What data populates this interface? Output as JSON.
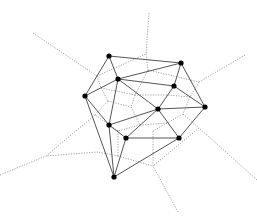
{
  "diagram": {
    "type": "delaunay-voronoi",
    "colors": {
      "background": "#ffffff",
      "delaunay_edge": "#555555",
      "voronoi_edge": "#8a8a8a",
      "site_point": "#000000"
    },
    "point_radius": 2.6,
    "points": [
      {
        "id": "P0",
        "x": 109,
        "y": 56
      },
      {
        "id": "P1",
        "x": 181,
        "y": 63
      },
      {
        "id": "P2",
        "x": 118,
        "y": 79
      },
      {
        "id": "P3",
        "x": 174,
        "y": 86
      },
      {
        "id": "P4",
        "x": 85,
        "y": 96
      },
      {
        "id": "P5",
        "x": 158,
        "y": 109
      },
      {
        "id": "P6",
        "x": 205,
        "y": 107
      },
      {
        "id": "P7",
        "x": 109,
        "y": 125
      },
      {
        "id": "P8",
        "x": 126,
        "y": 138
      },
      {
        "id": "P9",
        "x": 179,
        "y": 138
      },
      {
        "id": "P10",
        "x": 114,
        "y": 177
      }
    ],
    "delaunay_edges": [
      [
        0,
        1
      ],
      [
        0,
        2
      ],
      [
        0,
        4
      ],
      [
        1,
        2
      ],
      [
        1,
        3
      ],
      [
        1,
        6
      ],
      [
        2,
        3
      ],
      [
        2,
        4
      ],
      [
        2,
        5
      ],
      [
        2,
        7
      ],
      [
        3,
        5
      ],
      [
        3,
        6
      ],
      [
        4,
        7
      ],
      [
        4,
        10
      ],
      [
        5,
        6
      ],
      [
        5,
        7
      ],
      [
        5,
        8
      ],
      [
        5,
        9
      ],
      [
        6,
        9
      ],
      [
        7,
        8
      ],
      [
        7,
        10
      ],
      [
        8,
        9
      ],
      [
        8,
        10
      ],
      [
        9,
        10
      ]
    ],
    "voronoi_edges": [
      [
        [
          33,
          33
        ],
        [
          97,
          76
        ]
      ],
      [
        [
          97,
          76
        ],
        [
          101,
          88
        ]
      ],
      [
        [
          97,
          76
        ],
        [
          146,
          54
        ]
      ],
      [
        [
          149,
          13
        ],
        [
          146,
          54
        ]
      ],
      [
        [
          146,
          54
        ],
        [
          148,
          70
        ]
      ],
      [
        [
          148,
          70
        ],
        [
          135,
          95
        ]
      ],
      [
        [
          148,
          70
        ],
        [
          199,
          82
        ]
      ],
      [
        [
          245,
          55
        ],
        [
          199,
          82
        ]
      ],
      [
        [
          199,
          82
        ],
        [
          190,
          97
        ]
      ],
      [
        [
          101,
          88
        ],
        [
          108,
          101
        ]
      ],
      [
        [
          101,
          88
        ],
        [
          135,
          95
        ]
      ],
      [
        [
          108,
          101
        ],
        [
          131,
          107
        ]
      ],
      [
        [
          108,
          101
        ],
        [
          95,
          115
        ]
      ],
      [
        [
          135,
          95
        ],
        [
          131,
          107
        ]
      ],
      [
        [
          131,
          107
        ],
        [
          140,
          125
        ]
      ],
      [
        [
          190,
          97
        ],
        [
          167,
          95
        ]
      ],
      [
        [
          167,
          95
        ],
        [
          135,
          95
        ]
      ],
      [
        [
          190,
          97
        ],
        [
          183,
          114
        ]
      ],
      [
        [
          183,
          114
        ],
        [
          167,
          123
        ]
      ],
      [
        [
          183,
          114
        ],
        [
          199,
          128
        ]
      ],
      [
        [
          257,
          180
        ],
        [
          199,
          128
        ]
      ],
      [
        [
          199,
          128
        ],
        [
          153,
          166
        ]
      ],
      [
        [
          167,
          123
        ],
        [
          140,
          125
        ]
      ],
      [
        [
          167,
          123
        ],
        [
          153,
          131
        ]
      ],
      [
        [
          153,
          131
        ],
        [
          153,
          166
        ]
      ],
      [
        [
          140,
          125
        ],
        [
          118,
          131
        ]
      ],
      [
        [
          118,
          131
        ],
        [
          95,
          115
        ]
      ],
      [
        [
          118,
          131
        ],
        [
          118,
          156
        ]
      ],
      [
        [
          118,
          156
        ],
        [
          153,
          166
        ]
      ],
      [
        [
          118,
          156
        ],
        [
          98,
          152
        ]
      ],
      [
        [
          178,
          212
        ],
        [
          153,
          166
        ]
      ],
      [
        [
          95,
          115
        ],
        [
          46,
          156
        ]
      ],
      [
        [
          98,
          152
        ],
        [
          46,
          156
        ]
      ],
      [
        [
          0,
          175
        ],
        [
          46,
          156
        ]
      ]
    ]
  }
}
